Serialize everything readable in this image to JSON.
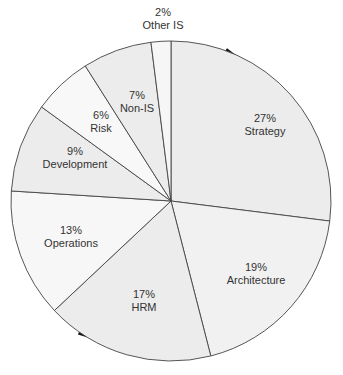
{
  "chart_data": {
    "type": "pie",
    "title": "",
    "start_angle_deg": 0,
    "direction": "clockwise",
    "slices": [
      {
        "label": "Strategy",
        "value": 27,
        "pct_label": "27%",
        "fill": "#ececec",
        "lx": 265,
        "ly": 112
      },
      {
        "label": "Architecture",
        "value": 19,
        "pct_label": "19%",
        "fill": "#f1f1f1",
        "lx": 256,
        "ly": 261
      },
      {
        "label": "HRM",
        "value": 17,
        "pct_label": "17%",
        "fill": "#ececec",
        "lx": 144,
        "ly": 288
      },
      {
        "label": "Operations",
        "value": 13,
        "pct_label": "13%",
        "fill": "#f7f7f7",
        "lx": 71,
        "ly": 224
      },
      {
        "label": "Development",
        "value": 9,
        "pct_label": "9%",
        "fill": "#ececec",
        "lx": 75,
        "ly": 145
      },
      {
        "label": "Risk",
        "value": 6,
        "pct_label": "6%",
        "fill": "#f8f8f8",
        "lx": 101,
        "ly": 109
      },
      {
        "label": "Non-IS",
        "value": 7,
        "pct_label": "7%",
        "fill": "#ececec",
        "lx": 137,
        "ly": 89
      },
      {
        "label": "Other IS",
        "value": 2,
        "pct_label": "2%",
        "fill": "#f6f6f6",
        "lx": 163,
        "ly": 6
      }
    ],
    "categories": [
      "Strategy",
      "Architecture",
      "HRM",
      "Operations",
      "Development",
      "Risk",
      "Non-IS",
      "Other IS"
    ],
    "values": [
      27,
      19,
      17,
      13,
      9,
      6,
      7,
      2
    ],
    "legend": "none (labels inside slices)"
  },
  "geometry": {
    "cx": 171,
    "cy": 201,
    "r": 160
  },
  "colors": {
    "edge": "#444444",
    "shadow": "#111111"
  }
}
